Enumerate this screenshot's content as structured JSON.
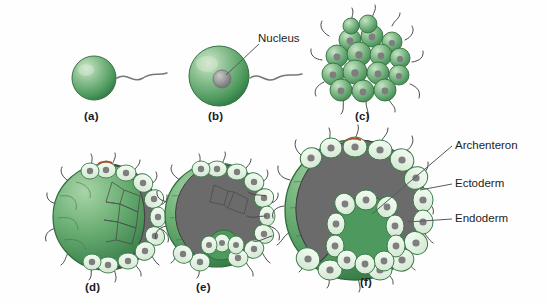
{
  "figure": {
    "background_color": "#fefefe",
    "line_color": "#2b2b2b",
    "colors": {
      "cell_green_light": "#9ecfa4",
      "cell_green_mid": "#5aa868",
      "cell_green_dark": "#2f7a45",
      "cell_pale": "#e4f1e2",
      "nucleus_gray": "#8a8a8a",
      "cavity_gray": "#6b6b6b",
      "outline": "#2b2b2b",
      "label_text": "#1d1d1d"
    }
  },
  "panels": [
    {
      "id": "a",
      "label": "(a)",
      "stage_name": "sperm-or-unfertilized-egg",
      "description": "single green cell with flagellum"
    },
    {
      "id": "b",
      "label": "(b)",
      "stage_name": "fertilized-egg-zygote",
      "description": "larger green cell with gray nucleus and flagellum"
    },
    {
      "id": "c",
      "label": "(c)",
      "stage_name": "morula",
      "description": "cluster of green cells with cilia"
    },
    {
      "id": "d",
      "label": "(d)",
      "stage_name": "blastula",
      "description": "hollow sphere cutaway with ring of ciliated cells"
    },
    {
      "id": "e",
      "label": "(e)",
      "stage_name": "early-gastrula",
      "description": "invagination beginning at vegetal pole"
    },
    {
      "id": "f",
      "label": "(f)",
      "stage_name": "gastrula",
      "description": "deep archenteron with ectoderm and endoderm layers"
    }
  ],
  "callouts": [
    {
      "id": "nucleus",
      "text": "Nucleus"
    },
    {
      "id": "archenteron",
      "text": "Archenteron"
    },
    {
      "id": "ectoderm",
      "text": "Ectoderm"
    },
    {
      "id": "endoderm",
      "text": "Endoderm"
    }
  ]
}
